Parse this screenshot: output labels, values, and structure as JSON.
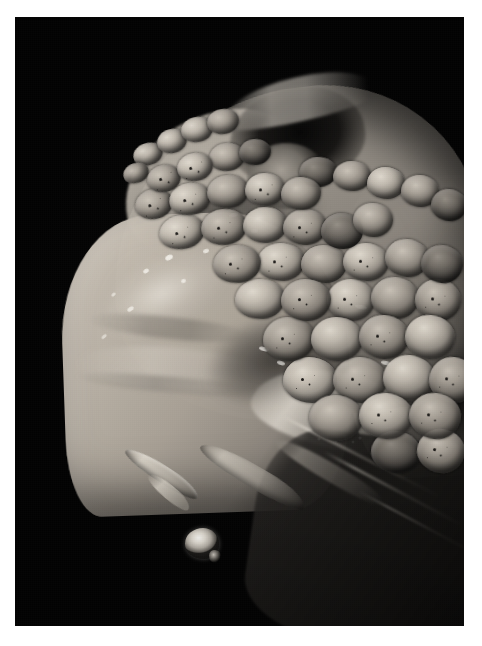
{
  "page": {
    "background_color": "#ffffff",
    "width": 482,
    "height": 646
  },
  "photo": {
    "alt_text": "Macro photograph of a venomous snake's open mouth showing a fang with a venom droplet",
    "subject": "snake-head-open-mouth",
    "background_color": "#030303",
    "frame": {
      "left": 15,
      "top": 17,
      "width": 449,
      "height": 609
    },
    "palette": {
      "background": "#030303",
      "scale_highlight": "#cdc6bb",
      "scale_midtone": "#a39c92",
      "scale_shadow": "#4c4944",
      "mouth_membrane": "#beb6a8",
      "fang": "#d8d0c3",
      "venom_droplet": "#fffef9",
      "lower_jaw": "#161514",
      "specular": "#fffdf7"
    }
  },
  "regions": {
    "crown": "scaly-head-crown",
    "crown_ridge": "canthal-ridge-highlight",
    "eye": "eye-socket-dark-hollow",
    "eye_rim": "supraocular-rim-highlight",
    "mouth": "buccal-membrane-open-mouth",
    "fang_main": "primary-fang",
    "fang_second": "secondary-fang",
    "fang_third": "rear-tooth",
    "venom_drop": "venom-droplet",
    "lower_jaw": "lower-jaw-shadowed",
    "neck": "neck-body-scales",
    "glints": "wet-specular-highlights"
  },
  "scales": [
    {
      "x": 118,
      "y": 126,
      "w": 30,
      "h": 22,
      "r": -18,
      "tone": "light",
      "speck": false
    },
    {
      "x": 108,
      "y": 146,
      "w": 26,
      "h": 20,
      "r": -22,
      "tone": "",
      "speck": false
    },
    {
      "x": 142,
      "y": 112,
      "w": 30,
      "h": 24,
      "r": -14,
      "tone": "light",
      "speck": false
    },
    {
      "x": 166,
      "y": 100,
      "w": 32,
      "h": 25,
      "r": -12,
      "tone": "light",
      "speck": false
    },
    {
      "x": 192,
      "y": 92,
      "w": 32,
      "h": 25,
      "r": -10,
      "tone": "",
      "speck": false
    },
    {
      "x": 132,
      "y": 148,
      "w": 34,
      "h": 27,
      "r": -16,
      "tone": "",
      "speck": true
    },
    {
      "x": 162,
      "y": 136,
      "w": 36,
      "h": 28,
      "r": -12,
      "tone": "light",
      "speck": true
    },
    {
      "x": 194,
      "y": 126,
      "w": 36,
      "h": 28,
      "r": -9,
      "tone": "",
      "speck": false
    },
    {
      "x": 224,
      "y": 122,
      "w": 32,
      "h": 26,
      "r": -7,
      "tone": "dark",
      "speck": false
    },
    {
      "x": 120,
      "y": 172,
      "w": 38,
      "h": 30,
      "r": -16,
      "tone": "",
      "speck": true
    },
    {
      "x": 154,
      "y": 166,
      "w": 42,
      "h": 32,
      "r": -12,
      "tone": "light",
      "speck": true
    },
    {
      "x": 192,
      "y": 158,
      "w": 42,
      "h": 33,
      "r": -8,
      "tone": "",
      "speck": false
    },
    {
      "x": 230,
      "y": 156,
      "w": 40,
      "h": 33,
      "r": -5,
      "tone": "light",
      "speck": true
    },
    {
      "x": 266,
      "y": 160,
      "w": 40,
      "h": 33,
      "r": -3,
      "tone": "",
      "speck": false
    },
    {
      "x": 144,
      "y": 198,
      "w": 46,
      "h": 34,
      "r": -12,
      "tone": "light",
      "speck": true
    },
    {
      "x": 186,
      "y": 192,
      "w": 46,
      "h": 36,
      "r": -8,
      "tone": "",
      "speck": true
    },
    {
      "x": 228,
      "y": 190,
      "w": 44,
      "h": 36,
      "r": -4,
      "tone": "light",
      "speck": false
    },
    {
      "x": 268,
      "y": 192,
      "w": 44,
      "h": 36,
      "r": -2,
      "tone": "",
      "speck": true
    },
    {
      "x": 306,
      "y": 196,
      "w": 42,
      "h": 36,
      "r": 0,
      "tone": "dark",
      "speck": false
    },
    {
      "x": 338,
      "y": 186,
      "w": 40,
      "h": 34,
      "r": 2,
      "tone": "",
      "speck": false
    },
    {
      "x": 198,
      "y": 228,
      "w": 48,
      "h": 38,
      "r": -6,
      "tone": "",
      "speck": true
    },
    {
      "x": 242,
      "y": 226,
      "w": 48,
      "h": 38,
      "r": -3,
      "tone": "light",
      "speck": true
    },
    {
      "x": 286,
      "y": 228,
      "w": 46,
      "h": 38,
      "r": 0,
      "tone": "",
      "speck": false
    },
    {
      "x": 328,
      "y": 226,
      "w": 46,
      "h": 38,
      "r": 2,
      "tone": "light",
      "speck": true
    },
    {
      "x": 370,
      "y": 222,
      "w": 44,
      "h": 38,
      "r": 4,
      "tone": "",
      "speck": false
    },
    {
      "x": 406,
      "y": 228,
      "w": 42,
      "h": 38,
      "r": 6,
      "tone": "dark",
      "speck": false
    },
    {
      "x": 220,
      "y": 262,
      "w": 50,
      "h": 40,
      "r": -4,
      "tone": "light",
      "speck": false
    },
    {
      "x": 266,
      "y": 262,
      "w": 50,
      "h": 42,
      "r": -1,
      "tone": "",
      "speck": true
    },
    {
      "x": 312,
      "y": 262,
      "w": 48,
      "h": 42,
      "r": 2,
      "tone": "light",
      "speck": true
    },
    {
      "x": 356,
      "y": 260,
      "w": 48,
      "h": 42,
      "r": 4,
      "tone": "",
      "speck": false
    },
    {
      "x": 400,
      "y": 262,
      "w": 46,
      "h": 42,
      "r": 6,
      "tone": "",
      "speck": true
    },
    {
      "x": 248,
      "y": 300,
      "w": 52,
      "h": 44,
      "r": -2,
      "tone": "",
      "speck": true
    },
    {
      "x": 296,
      "y": 300,
      "w": 52,
      "h": 44,
      "r": 1,
      "tone": "light",
      "speck": false
    },
    {
      "x": 344,
      "y": 298,
      "w": 50,
      "h": 44,
      "r": 3,
      "tone": "",
      "speck": true
    },
    {
      "x": 390,
      "y": 298,
      "w": 50,
      "h": 44,
      "r": 5,
      "tone": "light",
      "speck": false
    },
    {
      "x": 268,
      "y": 340,
      "w": 54,
      "h": 46,
      "r": 0,
      "tone": "light",
      "speck": true
    },
    {
      "x": 318,
      "y": 340,
      "w": 54,
      "h": 46,
      "r": 2,
      "tone": "",
      "speck": true
    },
    {
      "x": 368,
      "y": 338,
      "w": 52,
      "h": 46,
      "r": 4,
      "tone": "light",
      "speck": false
    },
    {
      "x": 414,
      "y": 340,
      "w": 48,
      "h": 46,
      "r": 6,
      "tone": "",
      "speck": true
    },
    {
      "x": 294,
      "y": 378,
      "w": 54,
      "h": 46,
      "r": 2,
      "tone": "",
      "speck": false
    },
    {
      "x": 344,
      "y": 376,
      "w": 54,
      "h": 46,
      "r": 4,
      "tone": "light",
      "speck": true
    },
    {
      "x": 394,
      "y": 376,
      "w": 52,
      "h": 46,
      "r": 6,
      "tone": "",
      "speck": true
    },
    {
      "x": 356,
      "y": 414,
      "w": 50,
      "h": 42,
      "r": 6,
      "tone": "dark",
      "speck": false
    },
    {
      "x": 402,
      "y": 412,
      "w": 48,
      "h": 44,
      "r": 8,
      "tone": "",
      "speck": true
    },
    {
      "x": 284,
      "y": 140,
      "w": 38,
      "h": 30,
      "r": -4,
      "tone": "dark",
      "speck": false
    },
    {
      "x": 318,
      "y": 144,
      "w": 38,
      "h": 30,
      "r": -2,
      "tone": "",
      "speck": false
    },
    {
      "x": 352,
      "y": 150,
      "w": 38,
      "h": 32,
      "r": 0,
      "tone": "light",
      "speck": false
    },
    {
      "x": 386,
      "y": 158,
      "w": 38,
      "h": 32,
      "r": 2,
      "tone": "",
      "speck": false
    },
    {
      "x": 416,
      "y": 172,
      "w": 36,
      "h": 32,
      "r": 4,
      "tone": "dark",
      "speck": false
    }
  ],
  "glints": [
    {
      "x": 128,
      "y": 252,
      "w": 6,
      "h": 4,
      "r": -30,
      "o": 0.75
    },
    {
      "x": 150,
      "y": 238,
      "w": 8,
      "h": 5,
      "r": -26,
      "o": 0.82
    },
    {
      "x": 166,
      "y": 262,
      "w": 5,
      "h": 4,
      "r": -20,
      "o": 0.7
    },
    {
      "x": 112,
      "y": 290,
      "w": 7,
      "h": 4,
      "r": -34,
      "o": 0.68
    },
    {
      "x": 96,
      "y": 276,
      "w": 5,
      "h": 3,
      "r": -40,
      "o": 0.6
    },
    {
      "x": 188,
      "y": 232,
      "w": 6,
      "h": 4,
      "r": -18,
      "o": 0.72
    },
    {
      "x": 210,
      "y": 254,
      "w": 5,
      "h": 3,
      "r": -14,
      "o": 0.62
    },
    {
      "x": 214,
      "y": 196,
      "w": 9,
      "h": 4,
      "r": -12,
      "o": 0.78
    },
    {
      "x": 236,
      "y": 212,
      "w": 7,
      "h": 4,
      "r": -8,
      "o": 0.66
    },
    {
      "x": 86,
      "y": 318,
      "w": 6,
      "h": 3,
      "r": -42,
      "o": 0.55
    },
    {
      "x": 244,
      "y": 330,
      "w": 10,
      "h": 4,
      "r": 14,
      "o": 0.72
    },
    {
      "x": 262,
      "y": 344,
      "w": 8,
      "h": 4,
      "r": 16,
      "o": 0.66
    },
    {
      "x": 286,
      "y": 356,
      "w": 6,
      "h": 3,
      "r": 18,
      "o": 0.58
    },
    {
      "x": 340,
      "y": 288,
      "w": 12,
      "h": 4,
      "r": 10,
      "o": 0.7
    },
    {
      "x": 366,
      "y": 344,
      "w": 10,
      "h": 4,
      "r": 12,
      "o": 0.64
    }
  ]
}
